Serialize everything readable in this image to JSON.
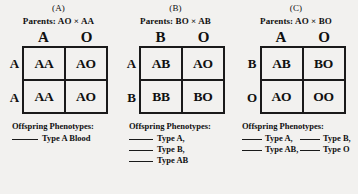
{
  "panels": [
    {
      "letter": "(A)",
      "parents": "Parents: AO × AA",
      "col_headers": [
        "A",
        "O"
      ],
      "row_headers": [
        "A",
        "A"
      ],
      "cells": [
        [
          "AA",
          "AO"
        ],
        [
          "AA",
          "AO"
        ]
      ],
      "phenotypes_title": "Offspring Phenotypes:",
      "phenotype_rows": [
        [
          {
            "label": "Type A Blood"
          }
        ]
      ]
    },
    {
      "letter": "(B)",
      "parents": "Parents: BO × AB",
      "col_headers": [
        "B",
        "O"
      ],
      "row_headers": [
        "A",
        "B"
      ],
      "cells": [
        [
          "AB",
          "AO"
        ],
        [
          "BB",
          "BO"
        ]
      ],
      "phenotypes_title": "Offspring Phenotypes:",
      "phenotype_rows": [
        [
          {
            "label": "Type A,"
          }
        ],
        [
          {
            "label": "Type B,"
          }
        ],
        [
          {
            "label": "Type AB"
          }
        ]
      ]
    },
    {
      "letter": "(C)",
      "parents": "Parents: AO × BO",
      "col_headers": [
        "A",
        "O"
      ],
      "row_headers": [
        "B",
        "O"
      ],
      "cells": [
        [
          "AB",
          "BO"
        ],
        [
          "AO",
          "OO"
        ]
      ],
      "phenotypes_title": "Offspring Phenotypes:",
      "phenotype_rows": [
        [
          {
            "label": "Type A,"
          },
          {
            "label": "Type B,"
          }
        ],
        [
          {
            "label": "Type AB,"
          },
          {
            "label": "Type O"
          }
        ]
      ]
    }
  ]
}
